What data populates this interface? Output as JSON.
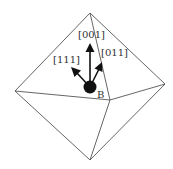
{
  "diagram": {
    "shape": "octahedron",
    "vertices": {
      "top": [
        90,
        13
      ],
      "left": [
        15,
        91
      ],
      "right": [
        165,
        84
      ],
      "bottom": [
        90,
        160
      ],
      "front": [
        110,
        100
      ]
    },
    "ball": {
      "label": "B",
      "center": [
        90,
        87
      ],
      "radius": 6,
      "color": "#111111"
    },
    "arrows": [
      {
        "label": "[001]",
        "from": [
          90,
          87
        ],
        "to": [
          90,
          45
        ],
        "label_pos": [
          78,
          36
        ]
      },
      {
        "label": "[111]",
        "from": [
          90,
          87
        ],
        "to": [
          72,
          68
        ],
        "label_pos": [
          50,
          62
        ]
      },
      {
        "label": "[011]",
        "from": [
          90,
          87
        ],
        "to": [
          101,
          64
        ],
        "label_pos": [
          99,
          55
        ]
      }
    ]
  }
}
